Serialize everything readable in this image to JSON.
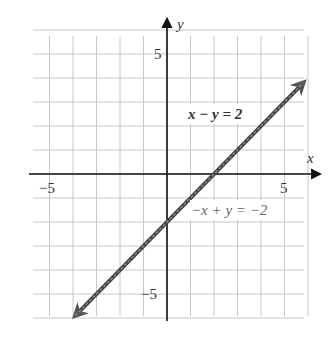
{
  "chart_data": {
    "type": "line",
    "title": "",
    "xlabel": "x",
    "ylabel": "y",
    "xlim": [
      -5.7,
      6.0
    ],
    "ylim": [
      -6.0,
      6.0
    ],
    "grid": true,
    "x_ticks": [
      {
        "value": -5,
        "label": "−5"
      },
      {
        "value": 5,
        "label": "5"
      }
    ],
    "y_ticks": [
      {
        "value": 5,
        "label": "5"
      },
      {
        "value": -5,
        "label": "−5"
      }
    ],
    "series": [
      {
        "name": "x − y = 2",
        "equation": "x - y = 2",
        "slope": 1,
        "intercept": -2,
        "x": [
          -3.9,
          5.8
        ],
        "y": [
          -5.9,
          3.8
        ],
        "color": "#444444",
        "arrows": "both"
      },
      {
        "name": "−x + y = −2",
        "equation": "-x + y = -2",
        "slope": 1,
        "intercept": -2,
        "x": [
          -3.9,
          5.8
        ],
        "y": [
          -5.9,
          3.8
        ],
        "color": "#888888",
        "arrows": "both"
      }
    ],
    "annotations": [
      {
        "text": "x − y = 2",
        "x": 1.0,
        "y": 2.4
      },
      {
        "text": "−x + y = −2",
        "x": 1.0,
        "y": -1.7
      }
    ],
    "legend": "none"
  },
  "labels": {
    "x_axis": "x",
    "y_axis": "y",
    "x_tick_neg5": "−5",
    "x_tick_5": "5",
    "y_tick_5": "5",
    "y_tick_neg5": "−5",
    "eq1": "x − y = 2",
    "eq2": "−x + y = −2"
  }
}
